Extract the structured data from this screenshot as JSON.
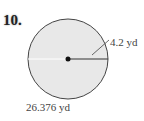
{
  "problem": {
    "number": "10.",
    "radius_label": "4.2 yd",
    "circumference_label": "26.376 yd",
    "colors": {
      "fill": "#e8e8e8",
      "stroke": "#444444"
    }
  }
}
